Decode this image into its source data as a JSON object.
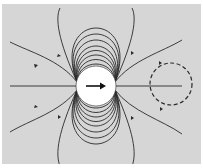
{
  "diagram": {
    "background_color": "#d6d6d6",
    "line_color": "#2a2a2a",
    "dipole": {
      "center": [
        96,
        86
      ],
      "radius": 20,
      "fill": "#ffffff",
      "arrow_direction": "right",
      "icon": "arrow-right-icon"
    },
    "axis_line": {
      "y": 86,
      "x_start": 10,
      "x_end": 182
    },
    "dashed_circle": {
      "center": [
        171,
        84
      ],
      "radius": 21
    },
    "field_line_count": 16
  }
}
